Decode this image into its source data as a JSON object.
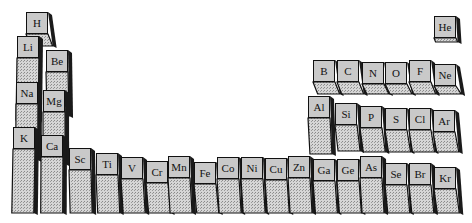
{
  "chart_data": {
    "type": "bar3d",
    "title": "",
    "elements": [
      {
        "symbol": "H",
        "period": 1,
        "group": 1,
        "x": 26,
        "y": 12,
        "h": 12
      },
      {
        "symbol": "He",
        "period": 1,
        "group": 18,
        "x": 434,
        "y": 16,
        "h": 4
      },
      {
        "symbol": "Li",
        "period": 2,
        "group": 1,
        "x": 17,
        "y": 36,
        "h": 62
      },
      {
        "symbol": "Be",
        "period": 2,
        "group": 2,
        "x": 46,
        "y": 50,
        "h": 44
      },
      {
        "symbol": "B",
        "period": 2,
        "group": 13,
        "x": 313,
        "y": 60,
        "h": 12
      },
      {
        "symbol": "C",
        "period": 2,
        "group": 14,
        "x": 337,
        "y": 60,
        "h": 12
      },
      {
        "symbol": "N",
        "period": 2,
        "group": 15,
        "x": 362,
        "y": 62,
        "h": 10
      },
      {
        "symbol": "O",
        "period": 2,
        "group": 16,
        "x": 385,
        "y": 62,
        "h": 10
      },
      {
        "symbol": "F",
        "period": 2,
        "group": 17,
        "x": 409,
        "y": 60,
        "h": 12
      },
      {
        "symbol": "Ne",
        "period": 2,
        "group": 18,
        "x": 434,
        "y": 64,
        "h": 8
      },
      {
        "symbol": "Na",
        "period": 3,
        "group": 1,
        "x": 16,
        "y": 82,
        "h": 56
      },
      {
        "symbol": "Mg",
        "period": 3,
        "group": 2,
        "x": 43,
        "y": 90,
        "h": 52
      },
      {
        "symbol": "Al",
        "period": 3,
        "group": 13,
        "x": 308,
        "y": 96,
        "h": 36
      },
      {
        "symbol": "Si",
        "period": 3,
        "group": 14,
        "x": 335,
        "y": 103,
        "h": 26
      },
      {
        "symbol": "P",
        "period": 3,
        "group": 15,
        "x": 360,
        "y": 106,
        "h": 24
      },
      {
        "symbol": "S",
        "period": 3,
        "group": 16,
        "x": 385,
        "y": 108,
        "h": 22
      },
      {
        "symbol": "Cl",
        "period": 3,
        "group": 17,
        "x": 409,
        "y": 108,
        "h": 22
      },
      {
        "symbol": "Ar",
        "period": 3,
        "group": 18,
        "x": 433,
        "y": 110,
        "h": 20
      },
      {
        "symbol": "K",
        "period": 4,
        "group": 1,
        "x": 13,
        "y": 127,
        "h": 64
      },
      {
        "symbol": "Ca",
        "period": 4,
        "group": 2,
        "x": 41,
        "y": 135,
        "h": 56
      },
      {
        "symbol": "Sc",
        "period": 4,
        "group": 3,
        "x": 69,
        "y": 148,
        "h": 43
      },
      {
        "symbol": "Ti",
        "period": 4,
        "group": 4,
        "x": 96,
        "y": 153,
        "h": 38
      },
      {
        "symbol": "V",
        "period": 4,
        "group": 5,
        "x": 121,
        "y": 157,
        "h": 34
      },
      {
        "symbol": "Cr",
        "period": 4,
        "group": 6,
        "x": 146,
        "y": 161,
        "h": 30
      },
      {
        "symbol": "Mn",
        "period": 4,
        "group": 7,
        "x": 168,
        "y": 156,
        "h": 35
      },
      {
        "symbol": "Fe",
        "period": 4,
        "group": 8,
        "x": 194,
        "y": 162,
        "h": 29
      },
      {
        "symbol": "Co",
        "period": 4,
        "group": 9,
        "x": 217,
        "y": 157,
        "h": 34
      },
      {
        "symbol": "Ni",
        "period": 4,
        "group": 10,
        "x": 241,
        "y": 157,
        "h": 34
      },
      {
        "symbol": "Cu",
        "period": 4,
        "group": 11,
        "x": 265,
        "y": 158,
        "h": 33
      },
      {
        "symbol": "Zn",
        "period": 4,
        "group": 12,
        "x": 288,
        "y": 156,
        "h": 35
      },
      {
        "symbol": "Ga",
        "period": 4,
        "group": 13,
        "x": 313,
        "y": 159,
        "h": 32
      },
      {
        "symbol": "Ge",
        "period": 4,
        "group": 14,
        "x": 337,
        "y": 159,
        "h": 32
      },
      {
        "symbol": "As",
        "period": 4,
        "group": 15,
        "x": 360,
        "y": 156,
        "h": 35
      },
      {
        "symbol": "Se",
        "period": 4,
        "group": 16,
        "x": 385,
        "y": 163,
        "h": 28
      },
      {
        "symbol": "Br",
        "period": 4,
        "group": 17,
        "x": 409,
        "y": 163,
        "h": 28
      },
      {
        "symbol": "Kr",
        "period": 4,
        "group": 18,
        "x": 434,
        "y": 167,
        "h": 24
      }
    ],
    "colors": {
      "face": "#c9c9c9",
      "side": "#1a1a1a",
      "shade": "#bdbdbd",
      "outline": "#111111"
    },
    "xlabel": "",
    "ylabel": "",
    "grid": false,
    "legend": null
  }
}
